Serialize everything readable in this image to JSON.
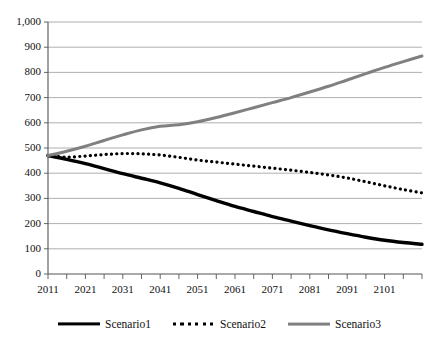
{
  "chart_data": {
    "type": "line",
    "title": "",
    "subtitle": "",
    "xlabel": "",
    "ylabel": "",
    "xlim": [
      2011,
      2111
    ],
    "ylim": [
      0,
      1000
    ],
    "grid": true,
    "legend_position": "bottom",
    "y_ticks": [
      "0",
      "100",
      "200",
      "300",
      "400",
      "500",
      "600",
      "700",
      "800",
      "900",
      "1,000"
    ],
    "y_tick_values": [
      0,
      100,
      200,
      300,
      400,
      500,
      600,
      700,
      800,
      900,
      1000
    ],
    "x_ticks": [
      "2011",
      "2021",
      "2031",
      "2041",
      "2051",
      "2061",
      "2071",
      "2081",
      "2091",
      "2101"
    ],
    "x_tick_values": [
      2011,
      2021,
      2031,
      2041,
      2051,
      2061,
      2071,
      2081,
      2091,
      2101
    ],
    "x_minor_step": 5,
    "x": [
      2011,
      2016,
      2021,
      2026,
      2031,
      2036,
      2041,
      2046,
      2051,
      2056,
      2061,
      2066,
      2071,
      2076,
      2081,
      2086,
      2091,
      2096,
      2101,
      2106,
      2111
    ],
    "series": [
      {
        "name": "Scenario1",
        "style": "solid",
        "color": "#000000",
        "width": 3.4,
        "values": [
          470,
          455,
          438,
          418,
          398,
          380,
          362,
          340,
          315,
          291,
          268,
          248,
          228,
          210,
          192,
          175,
          160,
          146,
          134,
          125,
          118
        ]
      },
      {
        "name": "Scenario2",
        "style": "dotted",
        "color": "#000000",
        "width": 3.2,
        "values": [
          470,
          464,
          468,
          474,
          478,
          477,
          472,
          463,
          452,
          444,
          436,
          428,
          420,
          412,
          403,
          393,
          381,
          366,
          350,
          335,
          322
        ]
      },
      {
        "name": "Scenario3",
        "style": "solid",
        "color": "#808080",
        "width": 3.0,
        "values": [
          470,
          487,
          507,
          530,
          552,
          572,
          586,
          592,
          604,
          621,
          640,
          660,
          680,
          700,
          722,
          745,
          770,
          795,
          820,
          843,
          865
        ]
      }
    ]
  },
  "legend": {
    "items": [
      {
        "label": "Scenario1"
      },
      {
        "label": "Scenario2"
      },
      {
        "label": "Scenario3"
      }
    ]
  },
  "axes": {
    "plot_left": 48,
    "plot_right": 422,
    "plot_top": 22,
    "plot_bottom": 274
  }
}
